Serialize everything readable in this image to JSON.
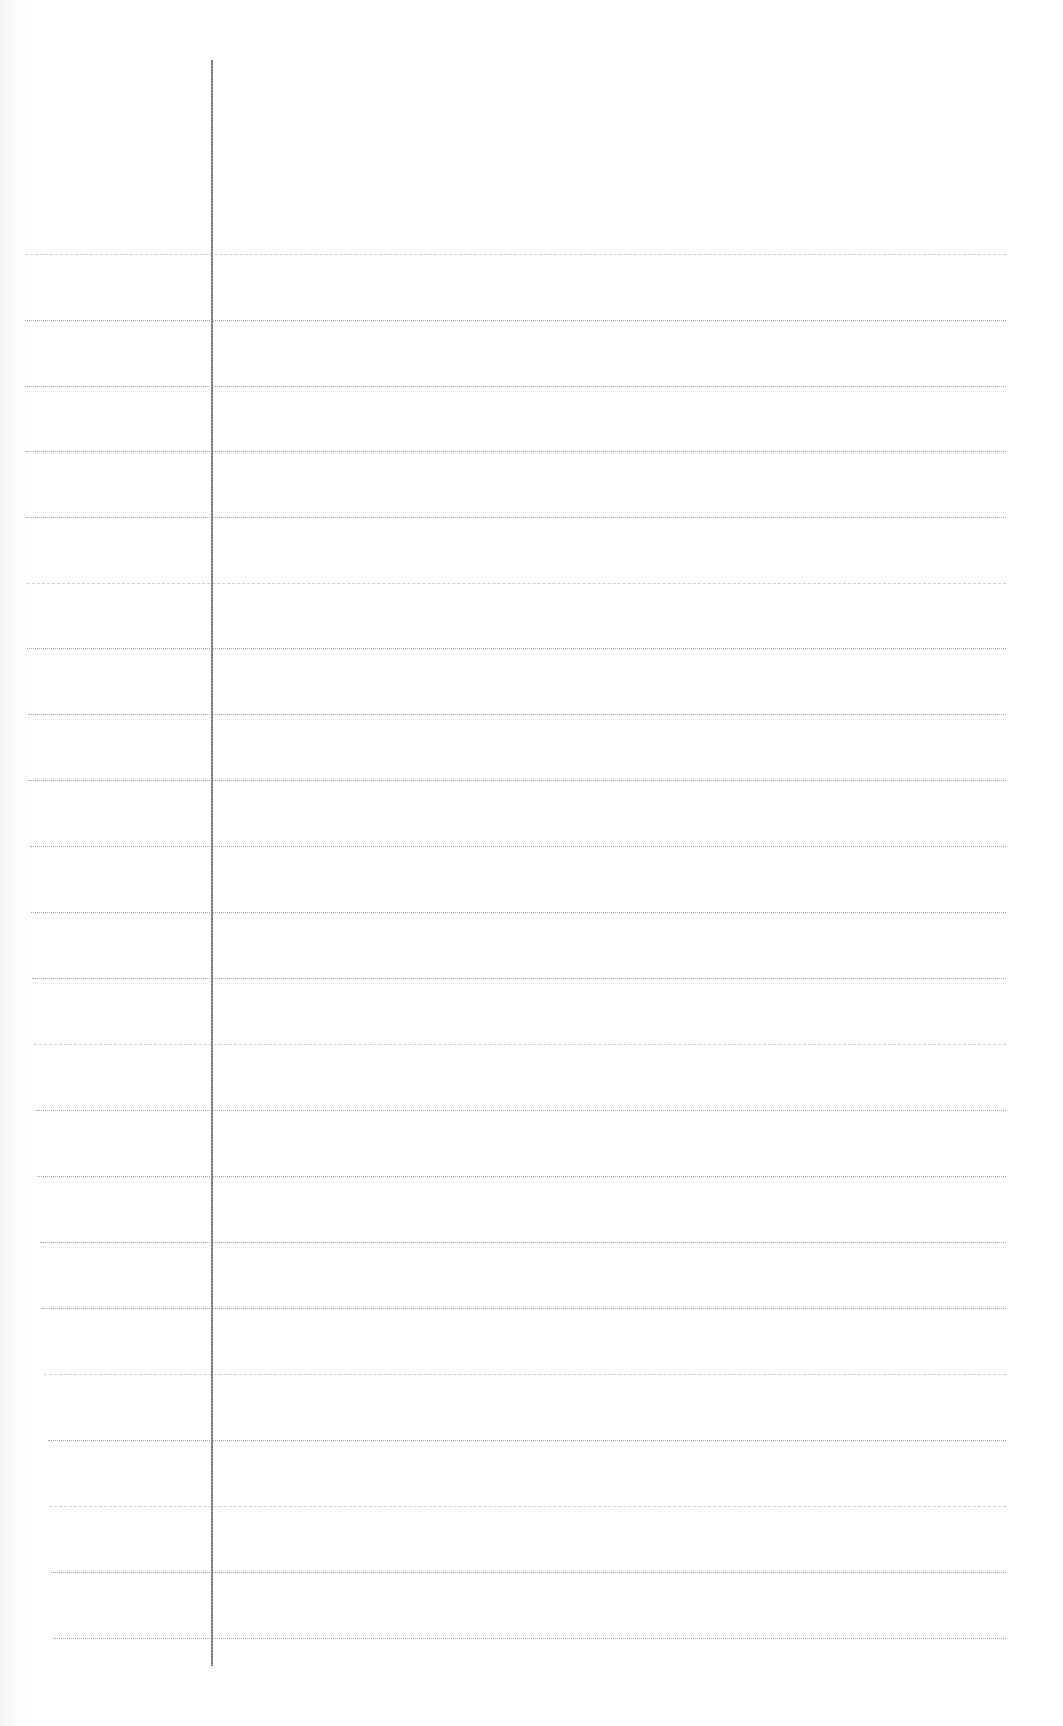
{
  "page": {
    "type": "lined-paper",
    "background_color": "#ffffff",
    "rule_color": "#a8a8a8",
    "margin_line_color": "#7a7a7a",
    "margin_line": {
      "x": 211,
      "top": 60,
      "bottom": 1666
    },
    "rule_right_edge": 1006,
    "rules": [
      {
        "y": 254,
        "left": 25,
        "faint": true
      },
      {
        "y": 320,
        "left": 25,
        "faint": false
      },
      {
        "y": 386,
        "left": 25,
        "faint": false
      },
      {
        "y": 451,
        "left": 26,
        "faint": false
      },
      {
        "y": 517,
        "left": 26,
        "faint": false
      },
      {
        "y": 583,
        "left": 27,
        "faint": true
      },
      {
        "y": 648,
        "left": 27,
        "faint": false
      },
      {
        "y": 714,
        "left": 28,
        "faint": false
      },
      {
        "y": 780,
        "left": 28,
        "faint": false
      },
      {
        "y": 846,
        "left": 30,
        "faint": false
      },
      {
        "y": 912,
        "left": 31,
        "faint": false
      },
      {
        "y": 978,
        "left": 32,
        "faint": false
      },
      {
        "y": 1044,
        "left": 34,
        "faint": true
      },
      {
        "y": 1110,
        "left": 36,
        "faint": false
      },
      {
        "y": 1176,
        "left": 37,
        "faint": false
      },
      {
        "y": 1242,
        "left": 40,
        "faint": false
      },
      {
        "y": 1308,
        "left": 42,
        "faint": false
      },
      {
        "y": 1374,
        "left": 44,
        "faint": true
      },
      {
        "y": 1440,
        "left": 48,
        "faint": false
      },
      {
        "y": 1506,
        "left": 49,
        "faint": true
      },
      {
        "y": 1572,
        "left": 51,
        "faint": false
      },
      {
        "y": 1638,
        "left": 53,
        "faint": false
      }
    ]
  }
}
